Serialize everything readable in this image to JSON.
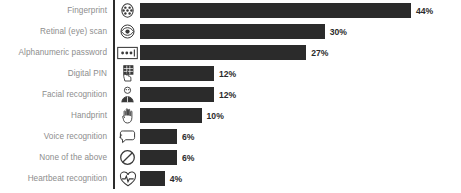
{
  "chart_data": {
    "type": "bar",
    "orientation": "horizontal",
    "title": "",
    "subtitle": "",
    "xlabel": "",
    "ylabel": "",
    "grid": false,
    "legend": null,
    "axis_line": "left",
    "value_suffix": "%",
    "xlim": [
      0,
      44
    ],
    "categories": [
      "Fingerprint",
      "Retinal (eye) scan",
      "Alphanumeric password",
      "Digital PIN",
      "Facial recognition",
      "Handprint",
      "Voice recognition",
      "None of the above",
      "Heartbeat recognition"
    ],
    "values": [
      44,
      30,
      27,
      12,
      12,
      10,
      6,
      6,
      4
    ],
    "value_labels": [
      "44%",
      "30%",
      "27%",
      "12%",
      "12%",
      "10%",
      "6%",
      "6%",
      "4%"
    ],
    "icons": [
      "fingerprint-icon",
      "eye-scan-icon",
      "password-field-icon",
      "pin-keypad-hand-icon",
      "face-recognition-icon",
      "handprint-icon",
      "voice-speech-bubble-icon",
      "prohibition-none-icon",
      "heartbeat-pulse-icon"
    ],
    "colors": {
      "bar": "#2b2b2b",
      "label": "#8d8d8d",
      "value": "#2b2b2b",
      "background": "#ffffff",
      "icon": "#3a3a3a"
    }
  }
}
